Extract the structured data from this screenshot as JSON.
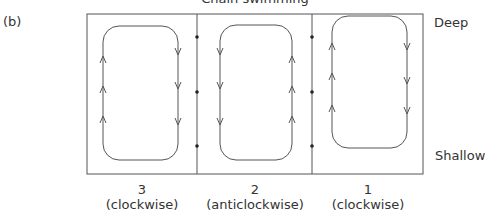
{
  "figure": {
    "panel_label": "(b)",
    "title": "Chain swimming",
    "depth_labels": {
      "top": "Deep",
      "bottom": "Shallow"
    },
    "cells": [
      {
        "number": "3",
        "direction": "(clockwise)"
      },
      {
        "number": "2",
        "direction": "(anticlockwise)"
      },
      {
        "number": "1",
        "direction": "(clockwise)"
      }
    ]
  }
}
